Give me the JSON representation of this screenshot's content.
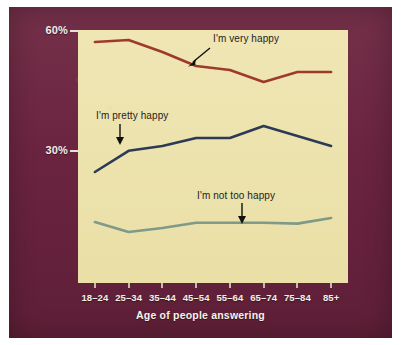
{
  "chart_data": {
    "type": "line",
    "title": "",
    "xlabel": "Age of people answering",
    "ylabel": "",
    "categories": [
      "18–24",
      "25–34",
      "35–44",
      "45–54",
      "55–64",
      "65–74",
      "75–84",
      "85+"
    ],
    "ytick_labels": [
      "60%",
      "30%"
    ],
    "ytick_values": [
      60,
      30
    ],
    "ylim": [
      0,
      60
    ],
    "grid": false,
    "legend": "inline-annotations",
    "series": [
      {
        "name": "I'm very happy",
        "color": "#9E3A2C",
        "values": [
          57.0,
          57.5,
          54.5,
          51.0,
          50.0,
          47.0,
          49.5,
          49.5
        ]
      },
      {
        "name": "I'm pretty happy",
        "color": "#2C3A55",
        "values": [
          24.5,
          29.8,
          31.0,
          33.0,
          33.0,
          36.0,
          33.5,
          31.0
        ]
      },
      {
        "name": "I'm not too happy",
        "color": "#7E9A88",
        "values": [
          12.0,
          9.5,
          10.5,
          11.8,
          11.8,
          11.8,
          11.6,
          13.0
        ]
      }
    ],
    "annotations": [
      {
        "text": "I'm very happy",
        "points_to": "very-happy-line",
        "arrow": "down-left"
      },
      {
        "text": "I'm pretty happy",
        "points_to": "pretty-happy-line",
        "arrow": "down"
      },
      {
        "text": "I'm not too happy",
        "points_to": "not-too-happy-line",
        "arrow": "down"
      }
    ]
  },
  "colors": {
    "border": "#6E2440",
    "plot_background": "#EDE3AE",
    "very_happy": "#9E3A2C",
    "pretty_happy": "#2C3A55",
    "not_too_happy": "#7E9A88",
    "axis_text": "#F2EDE4"
  }
}
